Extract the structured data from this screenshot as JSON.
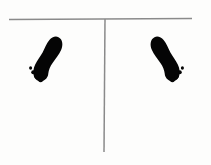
{
  "canvas": {
    "width": 211,
    "height": 165,
    "background_color": "#fdfdfc"
  },
  "diagram": {
    "line_color": "#8a8a8a",
    "footprint_color": "#050505",
    "axis": {
      "name": "t-shaped-guide",
      "horizontal": {
        "label": "horizontal-baseline",
        "x1": 9,
        "y1": 19.5,
        "x2": 192,
        "y2": 18.5,
        "stroke_width": 1.6
      },
      "vertical": {
        "label": "vertical-centerline",
        "x1": 105,
        "y1": 19,
        "x2": 104,
        "y2": 152,
        "stroke_width": 1.5
      }
    },
    "footprints": [
      {
        "name": "left-side-footprint",
        "side": "right-foot",
        "facing": "toes-up-left",
        "center_x": 46,
        "center_y": 62,
        "toe_dot_count": 4
      },
      {
        "name": "right-side-footprint",
        "side": "left-foot",
        "facing": "toes-up-right",
        "center_x": 167,
        "center_y": 62,
        "toe_dot_count": 4
      }
    ]
  }
}
